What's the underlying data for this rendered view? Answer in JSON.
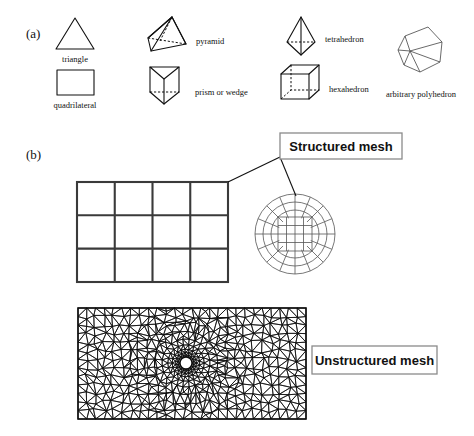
{
  "figure": {
    "panels": [
      {
        "id": "a",
        "label": "(a)"
      },
      {
        "id": "b",
        "label": "(b)"
      }
    ]
  },
  "panel_a": {
    "label": "(a)",
    "title": "Element types",
    "elements": [
      {
        "name": "triangle",
        "label": "triangle",
        "dim": "2D",
        "col": 1,
        "row": 1
      },
      {
        "name": "quadrilateral",
        "label": "quadrilateral",
        "dim": "2D",
        "col": 1,
        "row": 2
      },
      {
        "name": "pyramid",
        "label": "pyramid",
        "dim": "3D",
        "col": 2,
        "row": 1
      },
      {
        "name": "prism-or-wedge",
        "label": "prism or wedge",
        "dim": "3D",
        "col": 2,
        "row": 2
      },
      {
        "name": "tetrahedron",
        "label": "tetrahedron",
        "dim": "3D",
        "col": 3,
        "row": 1
      },
      {
        "name": "hexahedron",
        "label": "hexahedron",
        "dim": "3D",
        "col": 3,
        "row": 2
      },
      {
        "name": "arbitrary-polyhedron",
        "label": "arbitrary polyhedron",
        "dim": "3D",
        "col": 4,
        "row": 1
      }
    ]
  },
  "panel_b": {
    "label": "(b)",
    "title": "Mesh types",
    "callouts": [
      {
        "name": "structured-mesh",
        "label": "Structured mesh"
      },
      {
        "name": "unstructured-mesh",
        "label": "Unstructured mesh"
      }
    ],
    "structured_rect_grid": {
      "columns": 4,
      "rows": 3
    },
    "structured_circle_mesh": {
      "type": "o-grid butterfly",
      "radial_rings": 3,
      "circumferential_divisions": 16
    },
    "unstructured_mesh": {
      "type": "triangular",
      "feature": "refined around central hole"
    }
  },
  "colors": {
    "ink": "#111111",
    "grid": "#3a3a3a",
    "omesh": "#555555",
    "box_border": "#8a8a8a",
    "background": "#ffffff"
  }
}
